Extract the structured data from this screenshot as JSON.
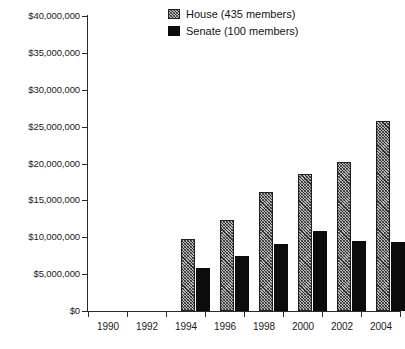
{
  "chart_data": {
    "type": "bar",
    "title": "",
    "subtitle": "",
    "xlabel": "",
    "ylabel": "",
    "categories": [
      "1990",
      "1992",
      "1994",
      "1996",
      "1998",
      "2000",
      "2002",
      "2004"
    ],
    "series": [
      {
        "name": "House (435 members)",
        "pattern": "hatched-gray",
        "color": "#b9b9b9",
        "values": [
          9800000,
          12400000,
          16100000,
          18600000,
          20200000,
          25700000,
          29000000,
          36400000
        ]
      },
      {
        "name": "Senate (100 members)",
        "pattern": "solid-black",
        "color": "#0d0d0d",
        "values": [
          5800000,
          7400000,
          9100000,
          10800000,
          9500000,
          9400000,
          10500000,
          22600000
        ]
      }
    ],
    "ylim": [
      0,
      40000000
    ],
    "ytick_values": [
      0,
      5000000,
      10000000,
      15000000,
      20000000,
      25000000,
      30000000,
      35000000,
      40000000
    ],
    "ytick_labels": [
      "$0",
      "$5,000,000",
      "$10,000,000",
      "$15,000,000",
      "$20,000,000",
      "$25,000,000",
      "$30,000,000",
      "$35,000,000",
      "$40,000,000"
    ],
    "grid": false,
    "legend_position": "top-center"
  },
  "legend": {
    "items": [
      {
        "label": "House (435 members)",
        "key": "house"
      },
      {
        "label": "Senate (100 members)",
        "key": "senate"
      }
    ]
  }
}
